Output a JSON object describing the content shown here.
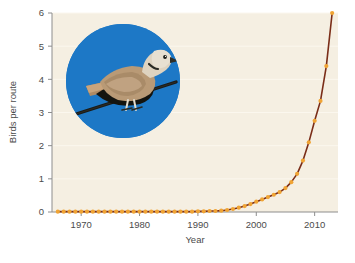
{
  "figure": {
    "background_color": "#ffffff",
    "plot_background_color": "#f5efe2",
    "axis_color": "#8d8d8d",
    "tick_text_color": "#4b4b4b",
    "marker_color": "#f0a434",
    "line_color": "#7a2d18",
    "gridline_color": "#fbf7ee"
  },
  "inset": {
    "name": "eurasian-collared-dove-photo",
    "background_color": "#1d78c6",
    "shape": "circle",
    "subject": "dove perched on branch"
  },
  "chart_data": {
    "type": "line",
    "title": "",
    "xlabel": "Year",
    "ylabel": "Birds per route",
    "xlim": [
      1965,
      2014
    ],
    "ylim": [
      0,
      6
    ],
    "xticks": [
      1970,
      1980,
      1990,
      2000,
      2010
    ],
    "xticklabels": [
      "1970",
      "1980",
      "1990",
      "2000",
      "2010"
    ],
    "yticks": [
      0,
      1,
      2,
      3,
      4,
      5,
      6
    ],
    "yticklabels": [
      "0",
      "1",
      "2",
      "3",
      "4",
      "5",
      "6"
    ],
    "grid": "horizontal-faint",
    "legend": "none",
    "marker": "circle",
    "series": [
      {
        "name": "Birds per route",
        "x": [
          1966,
          1967,
          1968,
          1969,
          1970,
          1971,
          1972,
          1973,
          1974,
          1975,
          1976,
          1977,
          1978,
          1979,
          1980,
          1981,
          1982,
          1983,
          1984,
          1985,
          1986,
          1987,
          1988,
          1989,
          1990,
          1991,
          1992,
          1993,
          1994,
          1995,
          1996,
          1997,
          1998,
          1999,
          2000,
          2001,
          2002,
          2003,
          2004,
          2005,
          2006,
          2007,
          2008,
          2009,
          2010,
          2011,
          2012,
          2013
        ],
        "values": [
          0.01,
          0.01,
          0.01,
          0.01,
          0.01,
          0.01,
          0.01,
          0.01,
          0.01,
          0.01,
          0.01,
          0.01,
          0.01,
          0.01,
          0.01,
          0.01,
          0.01,
          0.01,
          0.01,
          0.01,
          0.01,
          0.01,
          0.01,
          0.01,
          0.02,
          0.02,
          0.03,
          0.03,
          0.04,
          0.06,
          0.09,
          0.13,
          0.18,
          0.24,
          0.31,
          0.38,
          0.45,
          0.52,
          0.6,
          0.72,
          0.9,
          1.15,
          1.55,
          2.1,
          2.75,
          3.35,
          4.4,
          6.0
        ]
      }
    ]
  }
}
